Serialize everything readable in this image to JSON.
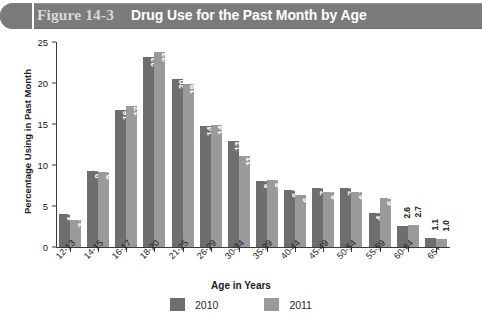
{
  "header": {
    "figure_number": "Figure 14-3",
    "title": "Drug Use for the Past Month by Age",
    "band_color": "#7b7b7b",
    "figure_number_color": "#d8d8d8",
    "title_color": "#ffffff"
  },
  "chart_data": {
    "type": "bar",
    "title": "Drug Use for the Past Month by Age",
    "xlabel": "Age in Years",
    "ylabel": "Percentage Using in Past Month",
    "ylim": [
      0,
      25
    ],
    "yticks": [
      0,
      5,
      10,
      15,
      20,
      25
    ],
    "grid": false,
    "legend_position": "bottom",
    "categories": [
      "12-13",
      "14-15",
      "16-17",
      "18-20",
      "21-25",
      "26-29",
      "30-34",
      "35-39",
      "40-44",
      "45-49",
      "50-54",
      "55-59",
      "60-64",
      "65+"
    ],
    "series": [
      {
        "name": "2010",
        "color": "#6e6e6e",
        "values": [
          4.0,
          9.3,
          16.7,
          23.2,
          20.5,
          14.8,
          12.9,
          8.1,
          6.9,
          7.2,
          7.2,
          4.1,
          2.6,
          1.1
        ],
        "labels": [
          "4.0",
          "9.3",
          "16.7",
          "23.2",
          "20.5",
          "14.8",
          "12.9",
          "8.1",
          "6.9",
          "7.2",
          "7.2",
          "4.1",
          "2.6",
          "1.1"
        ]
      },
      {
        "name": "2011",
        "color": "#9a9a9a",
        "values": [
          3.3,
          9.2,
          17.2,
          23.8,
          19.9,
          14.9,
          11.1,
          8.2,
          6.4,
          6.7,
          6.7,
          6.0,
          2.7,
          1.0
        ],
        "labels": [
          "3.3",
          "9.2",
          "17.2",
          "23.8",
          "19.9",
          "14.9",
          "11.1",
          "8.2",
          "6.4",
          "6.7",
          "6.7",
          "6.0",
          "2.7",
          "1.0"
        ]
      }
    ]
  },
  "legend": [
    {
      "label": "2010",
      "color": "#6e6e6e"
    },
    {
      "label": "2011",
      "color": "#9a9a9a"
    }
  ]
}
